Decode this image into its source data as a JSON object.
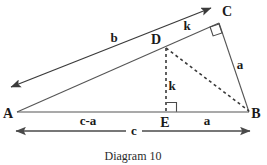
{
  "figure": {
    "caption": "Diagram 10",
    "vertices": [
      {
        "name": "A",
        "label": "A",
        "x": 17,
        "y": 112,
        "label_x": 8,
        "label_y": 118
      },
      {
        "name": "B",
        "label": "B",
        "x": 249,
        "y": 112,
        "label_x": 252,
        "label_y": 118
      },
      {
        "name": "C",
        "label": "C",
        "x": 219,
        "y": 23,
        "label_x": 223,
        "label_y": 16
      },
      {
        "name": "D",
        "label": "D",
        "x": 166,
        "y": 48,
        "label_x": 152,
        "label_y": 44
      },
      {
        "name": "E",
        "label": "E",
        "x": 166,
        "y": 112,
        "label_x": 160,
        "label_y": 126
      }
    ],
    "segment_labels": [
      {
        "name": "side-b",
        "text": "b",
        "x": 114,
        "y": 42
      },
      {
        "name": "side-k-upper",
        "text": "k",
        "x": 185,
        "y": 30
      },
      {
        "name": "side-a-right",
        "text": "a",
        "x": 238,
        "y": 68
      },
      {
        "name": "altitude-k",
        "text": "k",
        "x": 170,
        "y": 89
      },
      {
        "name": "base-c-minus-a",
        "text": "c-a",
        "x": 77,
        "y": 125
      },
      {
        "name": "base-a",
        "text": "a",
        "x": 203,
        "y": 125
      },
      {
        "name": "total-c",
        "text": "c",
        "x": 130,
        "y": 135
      }
    ],
    "colors": {
      "line": "#555555",
      "ray": "#3b3b3b",
      "dashed": "#3a3a3a",
      "dimension": "#4a4a4a",
      "text": "#1a1a1a",
      "background": "#ffffff"
    },
    "icons": {
      "right_angle_at_c": "right-angle-marker",
      "right_angle_at_e": "right-angle-marker",
      "ray_arrow": "arrowhead",
      "dimension_arrow": "double-arrowhead"
    }
  }
}
